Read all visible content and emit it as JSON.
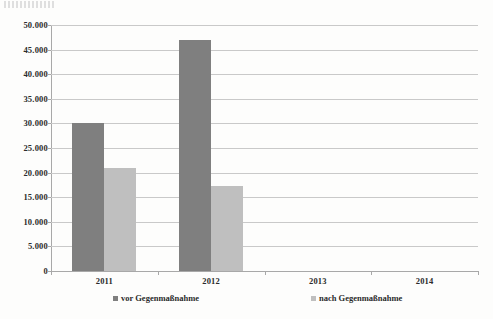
{
  "chart_data": {
    "type": "bar",
    "title": "",
    "subtitle": "",
    "xlabel": "",
    "ylabel": "",
    "categories": [
      "2011",
      "2012",
      "2013",
      "2014"
    ],
    "series": [
      {
        "name": "vor Gegenmaßnahme",
        "color": "#7f7f7f",
        "values": [
          30000,
          47000,
          null,
          null
        ]
      },
      {
        "name": "nach Gegenmaßnahme",
        "color": "#bfbfbf",
        "values": [
          21000,
          17300,
          null,
          null
        ]
      }
    ],
    "ylim": [
      0,
      50000
    ],
    "ytick_step": 5000,
    "ytick_labels": [
      "0",
      "5.000",
      "10.000",
      "15.000",
      "20.000",
      "25.000",
      "30.000",
      "35.000",
      "40.000",
      "45.000",
      "50.000"
    ],
    "grid": true,
    "grid_axis": "y",
    "legend_position": "bottom",
    "number_format": "de-DE"
  },
  "colors": {
    "background": "#fdfdfc",
    "gridline": "#c9c9c9",
    "axis": "#a8a8a8",
    "text": "#2b2b2b",
    "series_0": "#7f7f7f",
    "series_1": "#bfbfbf"
  }
}
